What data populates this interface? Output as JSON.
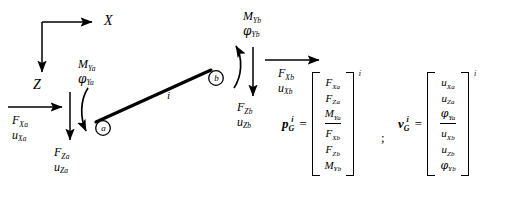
{
  "figure": {
    "type": "beam-element-free-body-diagram",
    "element_label": "i",
    "nodes": [
      {
        "id": "a",
        "label": "a"
      },
      {
        "id": "b",
        "label": "b"
      }
    ],
    "axes": {
      "x_label": "X",
      "z_label": "Z"
    },
    "node_a_loads": {
      "moment": "M",
      "moment_sub": "Ya",
      "rotation": "φ",
      "rotation_sub": "Ya",
      "force_x": "F",
      "force_x_sub": "Xa",
      "disp_x": "u",
      "disp_x_sub": "Xa",
      "force_z": "F",
      "force_z_sub": "Za",
      "disp_z": "u",
      "disp_z_sub": "Za"
    },
    "node_b_loads": {
      "moment": "M",
      "moment_sub": "Yb",
      "rotation": "φ",
      "rotation_sub": "Yb",
      "force_x": "F",
      "force_x_sub": "Xb",
      "disp_x": "u",
      "disp_x_sub": "Xb",
      "force_z": "F",
      "force_z_sub": "Zb",
      "disp_z": "u",
      "disp_z_sub": "Zb"
    }
  },
  "equations": {
    "separator": ";",
    "force_vector": {
      "name": "p",
      "subscript": "G",
      "superscript": "i",
      "equals": "=",
      "bracket_superscript": "i",
      "entries_top": [
        {
          "base": "F",
          "sub": "Xa"
        },
        {
          "base": "F",
          "sub": "Za"
        },
        {
          "base": "M",
          "sub": "Ya"
        }
      ],
      "entries_bottom": [
        {
          "base": "F",
          "sub": "Xb"
        },
        {
          "base": "F",
          "sub": "Zb"
        },
        {
          "base": "M",
          "sub": "Yb"
        }
      ]
    },
    "displacement_vector": {
      "name": "v",
      "subscript": "G",
      "superscript": "i",
      "equals": "=",
      "bracket_superscript": "i",
      "entries_top": [
        {
          "base": "u",
          "sub": "Xa"
        },
        {
          "base": "u",
          "sub": "Za"
        },
        {
          "base": "φ",
          "sub": "Ya"
        }
      ],
      "entries_bottom": [
        {
          "base": "u",
          "sub": "Xb"
        },
        {
          "base": "u",
          "sub": "Zb"
        },
        {
          "base": "φ",
          "sub": "Yb"
        }
      ]
    }
  },
  "colors": {
    "ink": "#000000",
    "background": "#ffffff"
  }
}
